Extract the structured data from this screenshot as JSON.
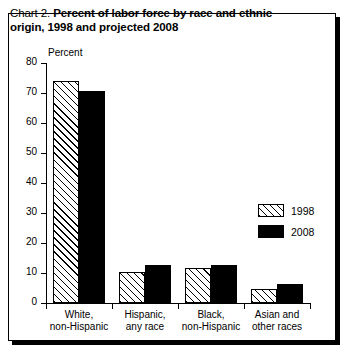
{
  "chart_data": {
    "type": "bar",
    "title": "Chart 2. Percent of labor force by race and ethnic origin, 1998 and projected 2008",
    "title_prefix": "Chart 2.",
    "title_bold_line1": "Percent of labor force by race and ethnic",
    "title_bold_line2": "origin, 1998 and projected 2008",
    "xlabel": "",
    "ylabel": "Percent",
    "ylim": [
      0,
      80
    ],
    "ytick_labels": [
      "0",
      "10",
      "20",
      "30",
      "40",
      "50",
      "60",
      "70",
      "80"
    ],
    "ytick_values": [
      0,
      10,
      20,
      30,
      40,
      50,
      60,
      70,
      80
    ],
    "grid": false,
    "legend_position": "center-right",
    "categories": [
      "White, non-Hispanic",
      "Hispanic, any race",
      "Black, non-Hispanic",
      "Asian and other races"
    ],
    "category_lines": [
      [
        "White,",
        "non-Hispanic"
      ],
      [
        "Hispanic,",
        "any race"
      ],
      [
        "Black,",
        "non-Hispanic"
      ],
      [
        "Asian and",
        "other races"
      ]
    ],
    "series": [
      {
        "name": "1998",
        "values": [
          73.9,
          10.4,
          11.8,
          4.6
        ],
        "fill": "diagonal-hatch",
        "color": "#ffffff"
      },
      {
        "name": "2008",
        "values": [
          70.7,
          12.7,
          12.6,
          6.2
        ],
        "fill": "solid",
        "color": "#000000"
      }
    ]
  },
  "legend": {
    "entries": [
      {
        "label": "1998",
        "swatch": "hatched-swatch"
      },
      {
        "label": "2008",
        "swatch": "solid-black-swatch"
      }
    ]
  },
  "colors": {
    "frame": "#000000",
    "axis": "#000000",
    "background": "#ffffff",
    "series_2008": "#000000"
  }
}
